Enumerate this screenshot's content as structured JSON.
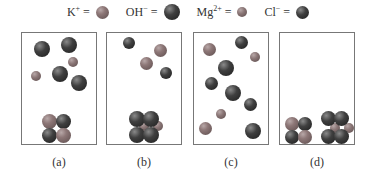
{
  "legend": [
    {
      "ion": "K",
      "charge": "+",
      "equals": "=",
      "species": "K",
      "icon": "potassium-ion-ball"
    },
    {
      "ion": "OH",
      "charge": "−",
      "equals": "=",
      "species": "OH",
      "icon": "hydroxide-ion-ball"
    },
    {
      "ion": "Mg",
      "charge": "2+",
      "equals": "=",
      "species": "Mg",
      "icon": "magnesium-ion-ball"
    },
    {
      "ion": "Cl",
      "charge": "−",
      "equals": "=",
      "species": "Cl",
      "icon": "chloride-ion-ball"
    }
  ],
  "panels": [
    {
      "label": "(a)"
    },
    {
      "label": "(b)"
    },
    {
      "label": "(c)"
    },
    {
      "label": "(d)"
    }
  ]
}
